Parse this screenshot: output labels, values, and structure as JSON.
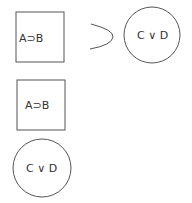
{
  "diagram": {
    "premise": {
      "shape": "square",
      "label": "A⊃B"
    },
    "connective": {
      "shape": "arc",
      "meaning": "horseshoe-implication"
    },
    "conclusion": {
      "shape": "circle",
      "label": "C ∨ D"
    },
    "box2": {
      "shape": "square",
      "label": "A⊃B"
    },
    "circle2": {
      "shape": "circle",
      "label": "C ∨ D"
    }
  },
  "colors": {
    "stroke": "#555555",
    "text": "#333333",
    "background": "#ffffff"
  }
}
